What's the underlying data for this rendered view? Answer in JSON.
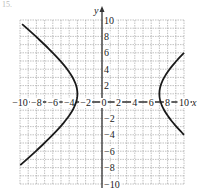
{
  "problem_label": "15.",
  "chart_data": {
    "type": "line",
    "title": "",
    "xlabel": "x",
    "ylabel": "y",
    "xlim": [
      -10,
      10
    ],
    "ylim": [
      -10,
      10
    ],
    "grid": true,
    "grid_step": 1,
    "x_ticks": [
      -10,
      -8,
      -6,
      -4,
      -2,
      0,
      2,
      4,
      6,
      8,
      10
    ],
    "y_ticks": [
      -10,
      -8,
      -6,
      -4,
      -2,
      2,
      4,
      6,
      8,
      10
    ],
    "x_tick_labels": [
      "−10",
      "−8",
      "−6",
      "−4",
      "−2",
      "0",
      "2",
      "4",
      "6",
      "8",
      "10"
    ],
    "y_tick_labels": [
      "−10",
      "−8",
      "−6",
      "−4",
      "−2",
      "2",
      "4",
      "6",
      "8",
      "10"
    ],
    "curve": {
      "description": "Horizontal hyperbola",
      "equation": "(x-2)^2/25 - (y-1)^2/16 = 1",
      "center": [
        2,
        1
      ],
      "vertices": [
        [
          -3,
          1
        ],
        [
          7,
          1
        ]
      ],
      "left_branch_endpoints": [
        [
          -10,
          9.5
        ],
        [
          -10,
          -7.7
        ]
      ],
      "right_branch_endpoints": [
        [
          10,
          6
        ],
        [
          10,
          -4
        ]
      ]
    },
    "colors": {
      "curve": "#1a1a1a",
      "grid": "#999999",
      "axes": "#333333"
    }
  }
}
